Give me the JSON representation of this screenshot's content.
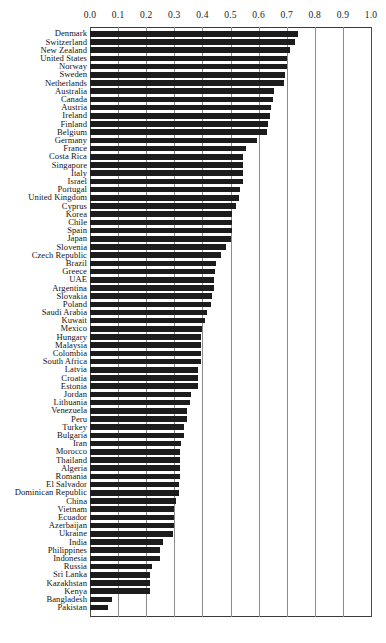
{
  "chart_data": {
    "type": "bar",
    "orientation": "horizontal",
    "title": "",
    "subtitle": "",
    "xlabel": "",
    "ylabel": "",
    "xlim": [
      0.0,
      1.0
    ],
    "xticks": [
      0.0,
      0.1,
      0.2,
      0.3,
      0.4,
      0.5,
      0.6,
      0.7,
      0.8,
      0.9,
      1.0
    ],
    "xtick_labels": [
      "0.0",
      "0.1",
      "0.2",
      "0.3",
      "0.4",
      "0.5",
      "0.6",
      "0.7",
      "0.8",
      "0.9",
      "1.0"
    ],
    "grid": true,
    "grid_axis": "x",
    "legend": false,
    "legend_position": "none",
    "bar_color": "#1c1c1c",
    "sorted": "descending",
    "categories": [
      "Denmark",
      "Switzerland",
      "New Zealand",
      "United States",
      "Norway",
      "Sweden",
      "Netherlands",
      "Australia",
      "Canada",
      "Austria",
      "Ireland",
      "Finland",
      "Belgium",
      "Germany",
      "France",
      "Costa Rica",
      "Singapore",
      "Italy",
      "Israel",
      "Portugal",
      "United Kingdom",
      "Cyprus",
      "Korea",
      "Chile",
      "Spain",
      "Japan",
      "Slovenia",
      "Czech Republic",
      "Brazil",
      "Greece",
      "UAE",
      "Argentina",
      "Slovakia",
      "Poland",
      "Saudi Arabia",
      "Kuwait",
      "Mexico",
      "Hungary",
      "Malaysia",
      "Colombia",
      "South Africa",
      "Latvia",
      "Croatia",
      "Estonia",
      "Jordan",
      "Lithuania",
      "Venezuela",
      "Peru",
      "Turkey",
      "Bulgaria",
      "Iran",
      "Morocco",
      "Thailand",
      "Algeria",
      "Romania",
      "El Salvador",
      "Dominican Republic",
      "China",
      "Vietnam",
      "Ecuador",
      "Azerbaijan",
      "Ukraine",
      "India",
      "Philippines",
      "Indonesia",
      "Russia",
      "Sri Lanka",
      "Kazakhstan",
      "Kenya",
      "Bangladesh",
      "Pakistan"
    ],
    "values": [
      0.74,
      0.73,
      0.71,
      0.7,
      0.7,
      0.695,
      0.69,
      0.655,
      0.65,
      0.645,
      0.64,
      0.635,
      0.63,
      0.595,
      0.555,
      0.545,
      0.545,
      0.545,
      0.545,
      0.535,
      0.53,
      0.52,
      0.505,
      0.505,
      0.505,
      0.5,
      0.485,
      0.465,
      0.45,
      0.445,
      0.44,
      0.44,
      0.435,
      0.43,
      0.415,
      0.41,
      0.4,
      0.395,
      0.395,
      0.395,
      0.395,
      0.385,
      0.385,
      0.385,
      0.36,
      0.355,
      0.345,
      0.345,
      0.335,
      0.335,
      0.325,
      0.32,
      0.32,
      0.32,
      0.32,
      0.315,
      0.315,
      0.305,
      0.3,
      0.3,
      0.3,
      0.295,
      0.26,
      0.25,
      0.25,
      0.22,
      0.215,
      0.215,
      0.215,
      0.08,
      0.065
    ]
  }
}
